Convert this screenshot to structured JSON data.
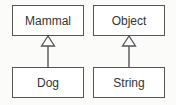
{
  "diagram": {
    "type": "uml-class-inheritance",
    "classes": [
      {
        "id": "mammal",
        "name": "Mammal",
        "x": 12,
        "y": 5,
        "w": 72,
        "h": 31
      },
      {
        "id": "object",
        "name": "Object",
        "x": 93,
        "y": 5,
        "w": 72,
        "h": 31
      },
      {
        "id": "dog",
        "name": "Dog",
        "x": 12,
        "y": 67,
        "w": 72,
        "h": 31
      },
      {
        "id": "string",
        "name": "String",
        "x": 93,
        "y": 67,
        "w": 72,
        "h": 31
      }
    ],
    "relations": [
      {
        "from": "Dog",
        "to": "Mammal",
        "kind": "generalization"
      },
      {
        "from": "String",
        "to": "Object",
        "kind": "generalization"
      }
    ],
    "colors": {
      "line": "#555555",
      "text": "#333333",
      "background": "#fbfbfa"
    }
  }
}
